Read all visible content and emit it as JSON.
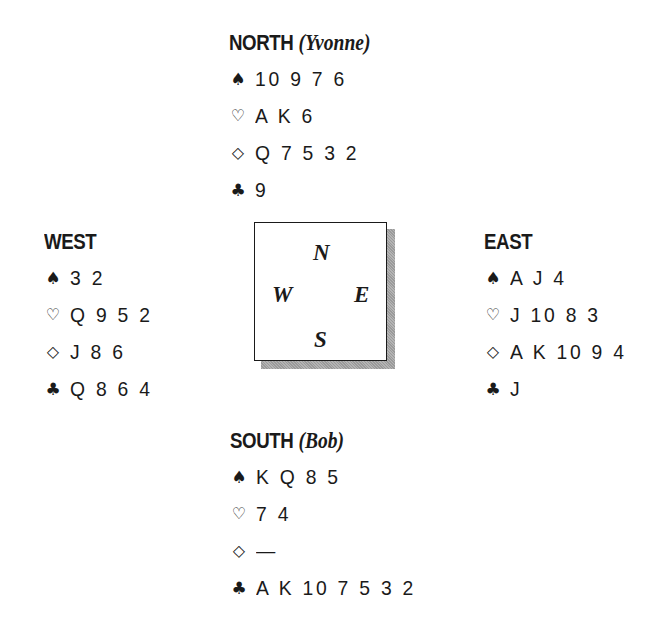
{
  "diagram": {
    "type": "bridge-hand-diagram",
    "hands": {
      "north": {
        "title": "NORTH",
        "player": "(Yvonne)",
        "spades": "10 9 7 6",
        "hearts": "A K 6",
        "diamonds": "Q 7 5 3 2",
        "clubs": "9"
      },
      "west": {
        "title": "WEST",
        "player": "",
        "spades": "3 2",
        "hearts": "Q 9 5 2",
        "diamonds": "J 8 6",
        "clubs": "Q 8 6 4"
      },
      "east": {
        "title": "EAST",
        "player": "",
        "spades": "A J 4",
        "hearts": "J 10 8 3",
        "diamonds": "A K 10 9 4",
        "clubs": "J"
      },
      "south": {
        "title": "SOUTH",
        "player": "(Bob)",
        "spades": "K Q 8 5",
        "hearts": "7 4",
        "diamonds": "—",
        "clubs": "A K 10 7 5 3 2"
      }
    },
    "suit_icons": {
      "spades": "♠",
      "hearts": "♡",
      "diamonds": "◇",
      "clubs": "♣"
    },
    "compass": {
      "n": "N",
      "s": "S",
      "e": "E",
      "w": "W"
    }
  }
}
